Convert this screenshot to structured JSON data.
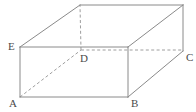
{
  "figure": {
    "name": "rectangular-prism",
    "background_color": "#ffffff",
    "stroke_color": "#8a8a8a",
    "hidden_stroke_color": "#9e9e9e",
    "label_color": "#4a4a4a"
  },
  "labels": [
    {
      "id": "A",
      "text": "A",
      "x": 9,
      "y": 98,
      "vertex_x": 20,
      "vertex_y": 97
    },
    {
      "id": "B",
      "text": "B",
      "x": 131,
      "y": 98,
      "vertex_x": 128,
      "vertex_y": 97
    },
    {
      "id": "C",
      "text": "C",
      "x": 186,
      "y": 52,
      "vertex_x": 183,
      "vertex_y": 51
    },
    {
      "id": "D",
      "text": "D",
      "x": 80,
      "y": 53,
      "vertex_x": 81,
      "vertex_y": 50
    },
    {
      "id": "E",
      "text": "E",
      "x": 8,
      "y": 41,
      "vertex_x": 20,
      "vertex_y": 47
    }
  ],
  "vertices": {
    "A": [
      20,
      97
    ],
    "B": [
      128,
      97
    ],
    "F": [
      128,
      47
    ],
    "E": [
      20,
      47
    ],
    "D": [
      81,
      50
    ],
    "C": [
      183,
      51
    ],
    "G": [
      80,
      5
    ],
    "H": [
      183,
      5
    ]
  },
  "edges": {
    "solid": [
      {
        "name": "edge-A-B",
        "points": "20,97 128,97"
      },
      {
        "name": "edge-A-E",
        "points": "20,97 20,47"
      },
      {
        "name": "edge-B-F",
        "points": "128,97 128,47"
      },
      {
        "name": "edge-E-F",
        "points": "20,47 128,47"
      },
      {
        "name": "edge-E-G",
        "points": "20,47 80,5"
      },
      {
        "name": "edge-F-H",
        "points": "128,47 183,5"
      },
      {
        "name": "edge-G-H",
        "points": "80,5 183,5"
      },
      {
        "name": "edge-B-C",
        "points": "128,97 183,51"
      },
      {
        "name": "edge-C-H",
        "points": "183,51 183,5"
      }
    ],
    "hidden": [
      {
        "name": "edge-A-D",
        "points": "20,97 81,50"
      },
      {
        "name": "edge-D-C",
        "points": "81,50 183,50"
      },
      {
        "name": "edge-D-G",
        "points": "81,50 80,5"
      }
    ]
  }
}
